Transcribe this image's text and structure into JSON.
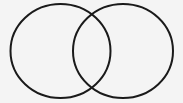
{
  "diagram": {
    "type": "venn",
    "background": "#f4f4f4",
    "stroke_color": "#1a1a1a",
    "stroke_width": 2,
    "sets": [
      {
        "name": "left-set",
        "cx": 60.5,
        "cy": 51,
        "rx": 50,
        "ry": 47,
        "label": ""
      },
      {
        "name": "right-set",
        "cx": 123,
        "cy": 51,
        "rx": 50,
        "ry": 47,
        "label": ""
      }
    ]
  }
}
